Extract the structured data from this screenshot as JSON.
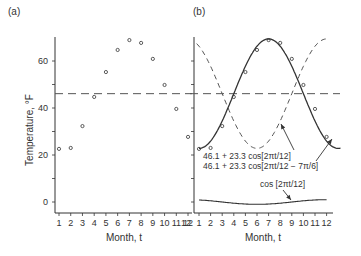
{
  "chart_data": [
    {
      "panel": "(a)",
      "type": "scatter",
      "title": "",
      "panel_label": "(a)",
      "xlabel": "Month, t",
      "ylabel": "Temperature, °F",
      "x": [
        1,
        2,
        3,
        4,
        5,
        6,
        7,
        8,
        9,
        10,
        11,
        12
      ],
      "x_tick_labels": [
        "1",
        "2",
        "3",
        "4",
        "5",
        "6",
        "7",
        "8",
        "9",
        "10",
        "11",
        "12"
      ],
      "y_tick_labels": [
        "0",
        "20",
        "40",
        "60"
      ],
      "ylim": [
        -5,
        70
      ],
      "series": [
        {
          "name": "Monthly temperature",
          "marker": "open-circle",
          "values": [
            22.6,
            23.0,
            32.3,
            44.7,
            55.3,
            64.7,
            68.9,
            67.7,
            60.9,
            49.8,
            39.6,
            27.7
          ]
        },
        {
          "name": "Mean",
          "style": "dashed-horizontal",
          "value": 46.1
        }
      ],
      "grid": false,
      "legend": null
    },
    {
      "panel": "(b)",
      "type": "line",
      "panel_label": "(b)",
      "xlabel": "Month, t",
      "ylabel": "",
      "x": [
        1,
        2,
        3,
        4,
        5,
        6,
        7,
        8,
        9,
        10,
        11,
        12
      ],
      "x_tick_labels": [
        "12",
        "1",
        "2",
        "3",
        "4",
        "5",
        "6",
        "7",
        "8",
        "9",
        "10",
        "11",
        "12"
      ],
      "ylim": [
        -5,
        70
      ],
      "series": [
        {
          "name": "46.1 + 23.3 cos[2πt/12]",
          "style": "dashed",
          "values": [
            66.3,
            57.8,
            46.1,
            34.4,
            25.9,
            22.8,
            25.9,
            34.4,
            46.1,
            57.8,
            66.3,
            69.4
          ]
        },
        {
          "name": "46.1 + 23.3 cos[2πt/12 − 7π/6]",
          "style": "solid",
          "values": [
            22.8,
            25.9,
            34.4,
            46.1,
            57.8,
            66.3,
            69.4,
            66.3,
            57.8,
            46.1,
            34.4,
            25.9
          ]
        },
        {
          "name": "cos [2πt/12]",
          "style": "solid-thin",
          "values": [
            0.87,
            0.5,
            0.0,
            -0.5,
            -0.87,
            -1.0,
            -0.87,
            -0.5,
            0.0,
            0.5,
            0.87,
            1.0
          ]
        },
        {
          "name": "Observations",
          "marker": "open-circle",
          "values": [
            22.6,
            23.0,
            32.3,
            44.7,
            55.3,
            64.7,
            68.9,
            67.7,
            60.9,
            49.8,
            39.6,
            27.7
          ]
        },
        {
          "name": "Mean",
          "style": "dashed-horizontal",
          "value": 46.1
        }
      ],
      "annotations": [
        "46.1 + 23.3  cos[2πt/12]",
        "46.1 + 23.3  cos[2πt/12 − 7π/6]",
        "cos [2πt/12]"
      ],
      "grid": false,
      "legend": null
    }
  ],
  "labels": {
    "panel_a": "(a)",
    "panel_b": "(b)",
    "ylabel": "Temperature, °F",
    "xlabel_a": "Month, t",
    "xlabel_b": "Month, t",
    "ann1": "46.1 + 23.3  cos[2πt/12]",
    "ann2": "46.1 + 23.3  cos[2πt/12 − 7π/6]",
    "ann3": "cos [2πt/12]"
  },
  "colors": {
    "ink": "#333333",
    "dashed": "#555555",
    "background": "#ffffff"
  }
}
